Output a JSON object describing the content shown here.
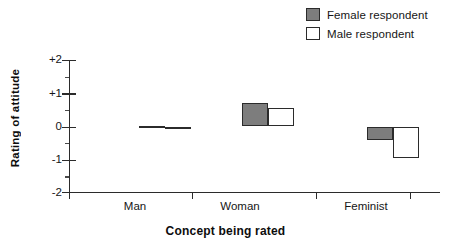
{
  "chart_data": {
    "type": "bar",
    "title": "",
    "xlabel": "Concept being rated",
    "ylabel": "Rating of attitude",
    "categories": [
      "Man",
      "Woman",
      "Feminist"
    ],
    "series": [
      {
        "name": "Female respondent",
        "color": "#7d7d7d",
        "values": [
          0.03,
          0.72,
          -0.42
        ]
      },
      {
        "name": "Male respondent",
        "color": "#ffffff",
        "values": [
          -0.08,
          0.55,
          -0.95
        ]
      }
    ],
    "ylim": [
      -2,
      2
    ],
    "ytick_labels": [
      "+2",
      "+1",
      "0",
      "-1",
      "-2"
    ],
    "ytick_values": [
      2,
      1,
      0,
      -1,
      -2
    ],
    "yminor_values": [
      1.5,
      0.5,
      -0.5,
      -1.5
    ],
    "grid": false,
    "legend_position": "top-right",
    "zero_baseline": 0,
    "bar_outline_color": "#2b2b2b",
    "axis_color": "#2b2b2b"
  },
  "legend": {
    "entries": [
      {
        "label": "Female respondent",
        "swatch": "filled-square-icon"
      },
      {
        "label": "Male respondent",
        "swatch": "hollow-square-icon"
      }
    ]
  },
  "axes": {
    "y_title": "Rating of attitude",
    "x_title": "Concept being rated",
    "y_labels": [
      "+2",
      "+1",
      "0",
      "-1",
      "-2"
    ],
    "x_labels": [
      "Man",
      "Woman",
      "Feminist"
    ]
  }
}
